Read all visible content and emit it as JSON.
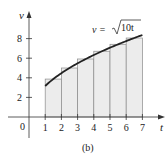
{
  "chart_data": {
    "type": "line",
    "title": "",
    "caption": "(b)",
    "xlabel": "t",
    "ylabel": "v",
    "curve_label": "v = √10t",
    "curve_formula": "v = sqrt(10 t)",
    "x_ticks": [
      1,
      2,
      3,
      4,
      5,
      6,
      7
    ],
    "y_ticks": [
      2,
      4,
      6,
      8
    ],
    "origin_label": "0",
    "xlim": [
      0,
      7.5
    ],
    "ylim": [
      0,
      9
    ],
    "grid": false,
    "curve": {
      "x": [
        1,
        1.5,
        2,
        2.5,
        3,
        3.5,
        4,
        4.5,
        5,
        5.5,
        6,
        6.5,
        7
      ],
      "y": [
        3.16,
        3.87,
        4.47,
        5.0,
        5.48,
        5.92,
        6.32,
        6.71,
        7.07,
        7.42,
        7.75,
        8.06,
        8.37
      ]
    },
    "rectangles": {
      "description": "Midpoint Riemann rectangles on [1,7], width 1",
      "x_left": [
        1,
        2,
        3,
        4,
        5,
        6
      ],
      "x_right": [
        2,
        3,
        4,
        5,
        6,
        7
      ],
      "heights": [
        3.87,
        5.0,
        5.92,
        6.71,
        7.42,
        8.06
      ]
    }
  },
  "labels": {
    "x_axis": "t",
    "y_axis": "v",
    "origin": "0",
    "curve": "v = ",
    "sqrt_arg": "10t",
    "caption": "(b)",
    "xt": [
      "1",
      "2",
      "3",
      "4",
      "5",
      "6",
      "7"
    ],
    "yt": [
      "2",
      "4",
      "6",
      "8"
    ]
  }
}
